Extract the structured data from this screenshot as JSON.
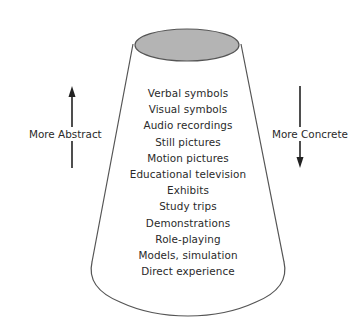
{
  "diagram": {
    "levels": [
      "Verbal symbols",
      "Visual symbols",
      "Audio recordings",
      "Still pictures",
      "Motion pictures",
      "Educational television",
      "Exhibits",
      "Study trips",
      "Demonstrations",
      "Role-playing",
      "Models, simulation",
      "Direct experience"
    ],
    "left_label": "More Abstract",
    "right_label": "More Concrete",
    "left_arrow_direction": "up",
    "right_arrow_direction": "down",
    "colors": {
      "cone_top_fill": "#b4b4b4",
      "outline": "#555555",
      "text": "#2a2a2a"
    }
  }
}
